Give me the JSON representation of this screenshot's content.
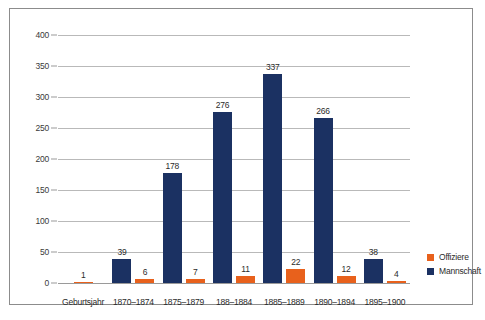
{
  "chart_data": {
    "type": "bar",
    "title": "",
    "xlabel": "Geburtsjahr",
    "ylabel": "",
    "ylim": [
      0,
      400
    ],
    "ytick_step": 50,
    "yticks": [
      0,
      50,
      100,
      150,
      200,
      250,
      300,
      350,
      400
    ],
    "grid": true,
    "legend_position": "right",
    "axis_label_slot": "Geburtsjahr",
    "categories": [
      "Geburtsjahr",
      "1870–1874",
      "1875–1879",
      "188–1884",
      "1885–1889",
      "1890–1894",
      "1895–1900"
    ],
    "series": [
      {
        "name": "Mannschaft",
        "color": "#1b3162",
        "values": [
          null,
          39,
          178,
          276,
          337,
          266,
          38
        ]
      },
      {
        "name": "Offiziere",
        "color": "#e8611c",
        "values": [
          1,
          6,
          7,
          11,
          22,
          12,
          4
        ]
      }
    ],
    "groups": [
      {
        "category": "Geburtsjahr",
        "mannschaft": null,
        "offiziere": 1
      },
      {
        "category": "1870–1874",
        "mannschaft": 39,
        "offiziere": 6
      },
      {
        "category": "1875–1879",
        "mannschaft": 178,
        "offiziere": 7
      },
      {
        "category": "188–1884",
        "mannschaft": 276,
        "offiziere": 11
      },
      {
        "category": "1885–1889",
        "mannschaft": 337,
        "offiziere": 22
      },
      {
        "category": "1890–1894",
        "mannschaft": 266,
        "offiziere": 12
      },
      {
        "category": "1895–1900",
        "mannschaft": 38,
        "offiziere": 4
      }
    ]
  },
  "legend": {
    "items": [
      {
        "label": "Offiziere",
        "color": "#e8611c"
      },
      {
        "label": "Mannschaft",
        "color": "#1b3162"
      }
    ]
  },
  "colors": {
    "mannschaft": "#1b3162",
    "offiziere": "#e8611c",
    "gridline": "#b9b9b9",
    "frame": "#8c8c8c",
    "text": "#2b2b2b",
    "background": "#ffffff"
  }
}
